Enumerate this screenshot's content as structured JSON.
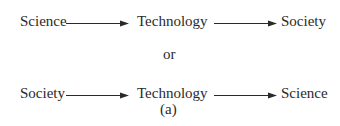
{
  "diagram": {
    "row1": {
      "nodes": [
        "Science",
        "Technology",
        "Society"
      ]
    },
    "separator": "or",
    "row2": {
      "nodes": [
        "Society",
        "Technology",
        "Science"
      ]
    },
    "caption": "(a)"
  }
}
